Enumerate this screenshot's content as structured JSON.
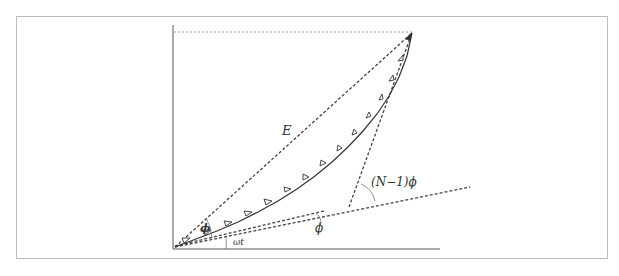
{
  "diagram": {
    "labels": {
      "resultant": "E",
      "phase_small": "ϕ",
      "phase_origin": "ωt",
      "phase_total": "(N−1)ϕ",
      "phase_step": "ϕ"
    },
    "colors": {
      "line": "#333333",
      "dashed": "#444444",
      "frame": "#bdbdbd"
    },
    "arrow_count": 14
  }
}
